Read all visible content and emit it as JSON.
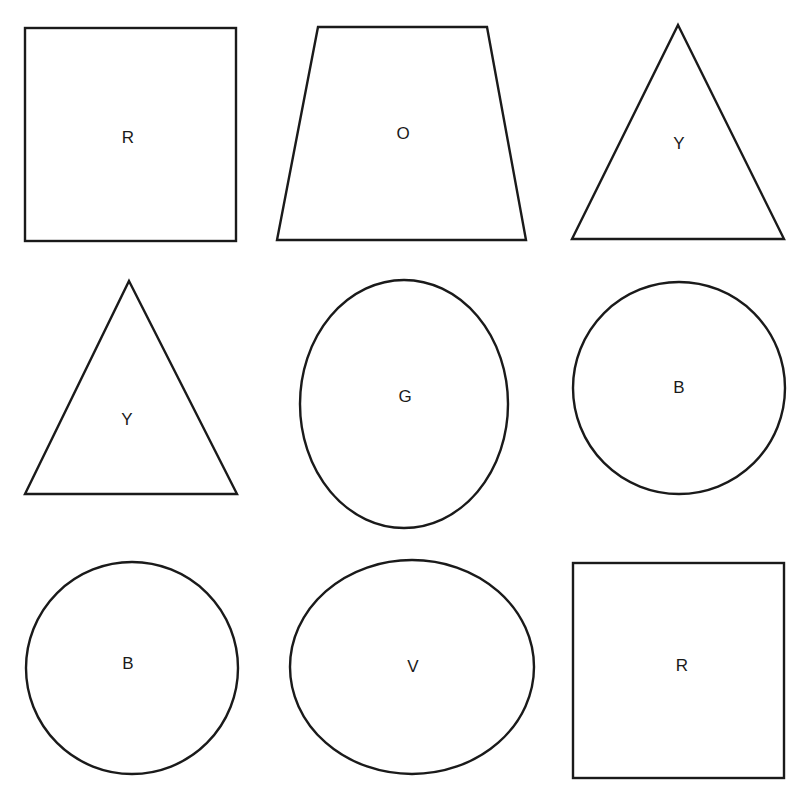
{
  "title": "",
  "grid": {
    "rows": 3,
    "columns": 3
  },
  "shapes": [
    {
      "type": "square",
      "label": "R",
      "row": 1,
      "col": 1
    },
    {
      "type": "trapezoid",
      "label": "O",
      "row": 1,
      "col": 2
    },
    {
      "type": "triangle",
      "label": "Y",
      "row": 1,
      "col": 3
    },
    {
      "type": "triangle",
      "label": "Y",
      "row": 2,
      "col": 1
    },
    {
      "type": "ellipse",
      "label": "G",
      "row": 2,
      "col": 2
    },
    {
      "type": "circle",
      "label": "B",
      "row": 2,
      "col": 3
    },
    {
      "type": "circle",
      "label": "B",
      "row": 3,
      "col": 1
    },
    {
      "type": "ellipse",
      "label": "V",
      "row": 3,
      "col": 2
    },
    {
      "type": "square",
      "label": "R",
      "row": 3,
      "col": 3
    }
  ],
  "colors": {
    "stroke": "#1a1a1a",
    "fill": "#ffffff",
    "background": "#ffffff"
  }
}
